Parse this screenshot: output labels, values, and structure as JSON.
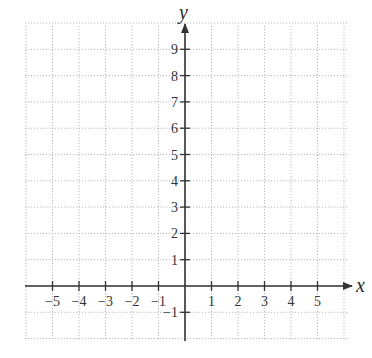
{
  "chart_data": {
    "type": "scatter",
    "title": "",
    "xlabel": "x",
    "ylabel": "y",
    "xlim": [
      -6,
      6
    ],
    "ylim": [
      -2,
      10
    ],
    "grid": true,
    "grid_style": "dotted",
    "legend": null,
    "x_ticks": [
      -5,
      -4,
      -3,
      -2,
      -1,
      1,
      2,
      3,
      4,
      5
    ],
    "x_tick_labels": [
      "−5",
      "−4",
      "−3",
      "−2",
      "−1",
      "1",
      "2",
      "3",
      "4",
      "5"
    ],
    "y_ticks": [
      -1,
      1,
      2,
      3,
      4,
      5,
      6,
      7,
      8,
      9
    ],
    "y_tick_labels": [
      "−1",
      "1",
      "2",
      "3",
      "4",
      "5",
      "6",
      "7",
      "8",
      "9"
    ],
    "series": [],
    "arrows": {
      "x_axis_positive": true,
      "y_axis_positive": true
    }
  },
  "colors": {
    "axis": "#333333",
    "grid": "#b8b8b8",
    "text": "#333333",
    "background": "#ffffff"
  },
  "layout": {
    "origin_px": [
      185,
      286
    ],
    "unit_px_x": 26.5,
    "unit_px_y": 26.3,
    "grid_left": 25,
    "grid_right": 349,
    "grid_top": 26,
    "grid_bottom": 341
  }
}
